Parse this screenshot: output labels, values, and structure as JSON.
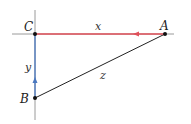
{
  "diagram": {
    "type": "right-triangle",
    "points": {
      "C": {
        "label": "C",
        "x": 35,
        "y": 34
      },
      "A": {
        "label": "A",
        "x": 165,
        "y": 34
      },
      "B": {
        "label": "B",
        "x": 35,
        "y": 98
      }
    },
    "segments": {
      "x": {
        "label": "x",
        "from": "C",
        "to": "A",
        "color": "#e0505a",
        "arrow": "toward C"
      },
      "y": {
        "label": "y",
        "from": "B",
        "to": "C",
        "color": "#4a78c0",
        "arrow": "toward C"
      },
      "z": {
        "label": "z",
        "from": "B",
        "to": "A",
        "color": "#222222"
      }
    },
    "axes": {
      "color": "#9a9a9a"
    }
  }
}
